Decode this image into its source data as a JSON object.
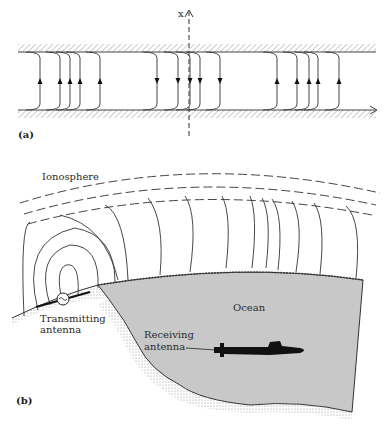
{
  "figure": {
    "panel_a": {
      "label": "(a)",
      "axis_label": "x",
      "field_lines_up_left": [
        40,
        60,
        70,
        80,
        100
      ],
      "field_lines_down_center": [
        157,
        178,
        190,
        200,
        220
      ],
      "field_lines_up_right": [
        277,
        297,
        309,
        318,
        339
      ]
    },
    "panel_b": {
      "label": "(b)",
      "ionosphere_label": "Ionosphere",
      "ocean_label": "Ocean",
      "transmitter_label_line1": "Transmitting",
      "transmitter_label_line2": "antenna",
      "receiver_label_line1": "Receiving",
      "receiver_label_line2": "antenna"
    },
    "colors": {
      "ocean": "#c8c8c8",
      "line": "#333333",
      "submarine": "#111111"
    }
  }
}
